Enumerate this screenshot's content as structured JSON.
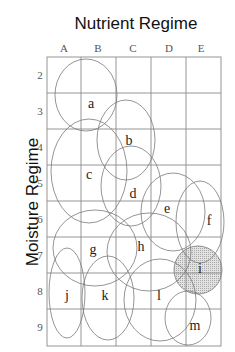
{
  "diagram": {
    "title_x": "Nutrient Regime",
    "title_y": "Moisture Regime",
    "columns": [
      "A",
      "B",
      "C",
      "D",
      "E"
    ],
    "rows": [
      "2",
      "3",
      "4",
      "5",
      "6",
      "7",
      "8",
      "9"
    ],
    "units": [
      {
        "label": "a",
        "shaded": false
      },
      {
        "label": "b",
        "shaded": false
      },
      {
        "label": "c",
        "shaded": false
      },
      {
        "label": "d",
        "shaded": false
      },
      {
        "label": "e",
        "shaded": false
      },
      {
        "label": "f",
        "shaded": false
      },
      {
        "label": "g",
        "shaded": false
      },
      {
        "label": "h",
        "shaded": false
      },
      {
        "label": "i",
        "shaded": true
      },
      {
        "label": "j",
        "shaded": false
      },
      {
        "label": "k",
        "shaded": false
      },
      {
        "label": "l",
        "shaded": false
      },
      {
        "label": "m",
        "shaded": false
      }
    ],
    "shade_color": "#d9d9d9"
  }
}
